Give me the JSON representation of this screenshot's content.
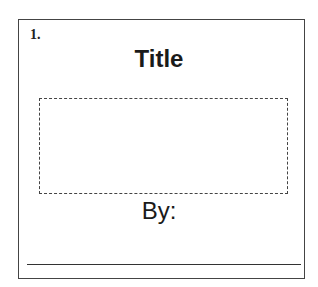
{
  "card": {
    "number": "1.",
    "title": "Title",
    "byline_label": "By:"
  }
}
